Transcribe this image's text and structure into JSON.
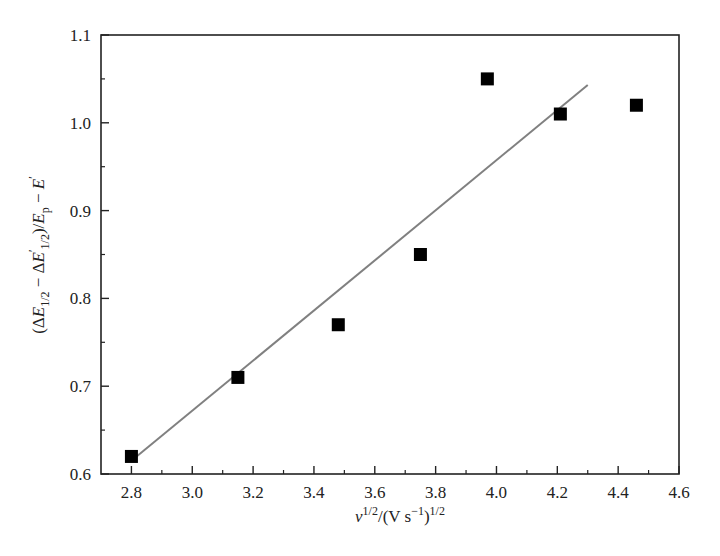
{
  "chart_data": {
    "type": "scatter",
    "title": "",
    "xlabel": "ν^1/2/(V s^-1)^1/2",
    "ylabel": "(ΔE_1/2 − ΔE'_1/2)/E_p − E'",
    "xlim": [
      2.7,
      4.6
    ],
    "ylim": [
      0.6,
      1.1
    ],
    "grid": false,
    "legend": null,
    "x_ticks": [
      "2.8",
      "3.0",
      "3.2",
      "3.4",
      "3.6",
      "3.8",
      "4.0",
      "4.2",
      "4.4",
      "4.6"
    ],
    "y_ticks": [
      "0.6",
      "0.7",
      "0.8",
      "0.9",
      "1.0",
      "1.1"
    ],
    "series": [
      {
        "name": "data",
        "marker": "square",
        "color": "#000000",
        "x": [
          2.8,
          3.15,
          3.48,
          3.75,
          3.97,
          4.21,
          4.46
        ],
        "y": [
          0.62,
          0.71,
          0.77,
          0.85,
          1.05,
          1.01,
          1.02
        ]
      },
      {
        "name": "linear fit",
        "type": "line",
        "color": "#808080",
        "x": [
          2.8,
          4.3
        ],
        "y": [
          0.615,
          1.043
        ]
      }
    ]
  },
  "labels": {
    "x_axis": {
      "nu": "ν",
      "sup1": "1/2",
      "mid": "/(V s",
      "sup2": "−1",
      "close": ")",
      "sup3": "1/2"
    },
    "y_axis": {
      "open": "(Δ",
      "E1": "E",
      "sub1": "1/2",
      "minus": " − Δ",
      "E2": "E",
      "prime2": "′",
      "sub2": "1/2",
      "mid": ")/",
      "E3": "E",
      "sub3": "p",
      "minus2": " − ",
      "E4": "E",
      "prime4": "′"
    }
  }
}
